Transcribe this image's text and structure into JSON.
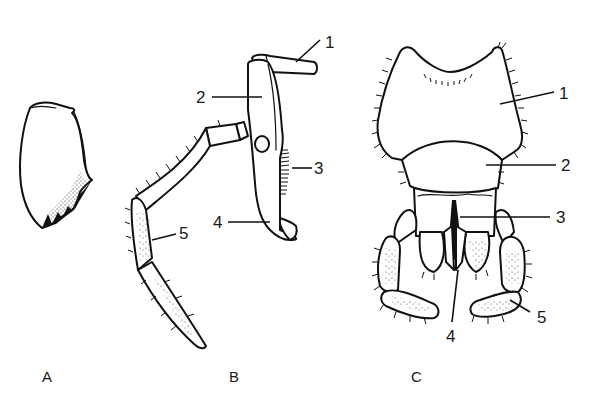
{
  "figure": {
    "panels": [
      {
        "id": "A",
        "letter": "A",
        "subject": "mandible",
        "labels": []
      },
      {
        "id": "B",
        "letter": "B",
        "subject": "maxilla",
        "labels": [
          {
            "num": "1",
            "part": "cardo"
          },
          {
            "num": "2",
            "part": "stipes"
          },
          {
            "num": "3",
            "part": "lacinia"
          },
          {
            "num": "4",
            "part": "galea"
          },
          {
            "num": "5",
            "part": "maxillary palp"
          }
        ]
      },
      {
        "id": "C",
        "letter": "C",
        "subject": "labium",
        "labels": [
          {
            "num": "1",
            "part": "submentum"
          },
          {
            "num": "2",
            "part": "mentum"
          },
          {
            "num": "3",
            "part": "prementum"
          },
          {
            "num": "4",
            "part": "glossa"
          },
          {
            "num": "5",
            "part": "labial palp"
          }
        ]
      }
    ],
    "colors": {
      "ink": "#111111",
      "background": "#ffffff"
    }
  }
}
